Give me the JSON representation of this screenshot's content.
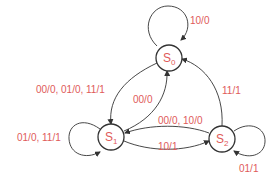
{
  "diagram": {
    "type": "finite-state-machine",
    "label_color": "#e05a5a",
    "line_color": "#333333",
    "states": [
      {
        "id": "S0",
        "name": "S",
        "subscript": "0"
      },
      {
        "id": "S1",
        "name": "S",
        "subscript": "1"
      },
      {
        "id": "S2",
        "name": "S",
        "subscript": "2"
      }
    ],
    "transitions": [
      {
        "from": "S0",
        "to": "S0",
        "label": "10/0"
      },
      {
        "from": "S0",
        "to": "S1",
        "label": "00/0, 01/0, 11/1"
      },
      {
        "from": "S1",
        "to": "S0",
        "label": "00/0"
      },
      {
        "from": "S1",
        "to": "S1",
        "label": "01/0, 11/1"
      },
      {
        "from": "S1",
        "to": "S2",
        "label": "10/1"
      },
      {
        "from": "S2",
        "to": "S1",
        "label": "00/0, 10/0"
      },
      {
        "from": "S2",
        "to": "S0",
        "label": "11/1"
      },
      {
        "from": "S2",
        "to": "S2",
        "label": "01/1"
      }
    ]
  }
}
